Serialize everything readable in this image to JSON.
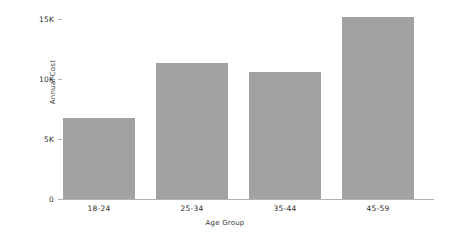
{
  "chart_data": {
    "type": "bar",
    "title": "",
    "subtitle": "",
    "xlabel": "Age Group",
    "ylabel": "Annual Cost",
    "categories": [
      "18-24",
      "25-34",
      "35-44",
      "45-59"
    ],
    "values": [
      6500,
      10900,
      10200,
      14600
    ],
    "series": [
      {
        "name": "Annual Cost",
        "values": [
          6500,
          10900,
          10200,
          14600
        ]
      }
    ],
    "ylim": [
      0,
      15000
    ],
    "yticks": [
      0,
      5000,
      10000,
      15000
    ],
    "ytick_labels": [
      "0",
      "5K",
      "10K",
      "15K"
    ],
    "xtick_labels": [
      "18-24",
      "25-34",
      "35-44",
      "45-59"
    ],
    "grid": false,
    "legend": false,
    "legend_position": "none",
    "annotations": [],
    "bar_color": "#a2a2a2",
    "axis_color": "#b3b3b3",
    "text_color": "#2e2e2e",
    "background_color": "#ffffff"
  }
}
